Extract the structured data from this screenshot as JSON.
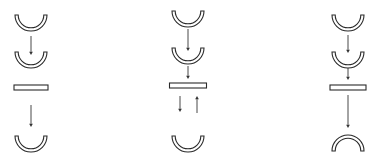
{
  "diagram": {
    "title": "",
    "colors": {
      "stroke": "#2a2a2a",
      "arrow": "#333333",
      "fill": "#ffffff",
      "background": "#ffffff"
    },
    "columns": [
      {
        "id": "column-1",
        "center_x": 31,
        "elements": [
          {
            "type": "cup-up",
            "cy": 13,
            "r": 16
          },
          {
            "type": "arrow-down",
            "y1": 36,
            "y2": 55
          },
          {
            "type": "cup-up",
            "cy": 50,
            "r": 16
          },
          {
            "type": "plate",
            "y": 85,
            "w": 34,
            "h": 5
          },
          {
            "type": "arrow-down",
            "y1": 105,
            "y2": 127
          },
          {
            "type": "cup-up",
            "cy": 134,
            "r": 16
          }
        ]
      },
      {
        "id": "column-2",
        "center_x": 188,
        "elements": [
          {
            "type": "cup-up",
            "cy": 9,
            "r": 16
          },
          {
            "type": "arrow-down",
            "y1": 29,
            "y2": 51
          },
          {
            "type": "cup-up",
            "cy": 46,
            "r": 16
          },
          {
            "type": "arrow-down",
            "y1": 66,
            "y2": 79
          },
          {
            "type": "plate",
            "y": 83,
            "w": 37,
            "h": 5
          },
          {
            "type": "arrow-down",
            "x_offset": -8,
            "y1": 96,
            "y2": 112
          },
          {
            "type": "arrow-up",
            "x_offset": 9,
            "y1": 96,
            "y2": 113
          },
          {
            "type": "cup-up",
            "cy": 134,
            "r": 16
          }
        ]
      },
      {
        "id": "column-3",
        "center_x": 348,
        "elements": [
          {
            "type": "cup-up",
            "cy": 13,
            "r": 16
          },
          {
            "type": "arrow-down",
            "y1": 35,
            "y2": 53
          },
          {
            "type": "cup-up",
            "cy": 50,
            "r": 16
          },
          {
            "type": "arrow-down",
            "y1": 68,
            "y2": 80
          },
          {
            "type": "plate",
            "y": 85,
            "w": 36,
            "h": 5
          },
          {
            "type": "arrow-down",
            "y1": 95,
            "y2": 128
          },
          {
            "type": "dome-down",
            "cy": 151,
            "r": 16
          }
        ]
      }
    ]
  }
}
